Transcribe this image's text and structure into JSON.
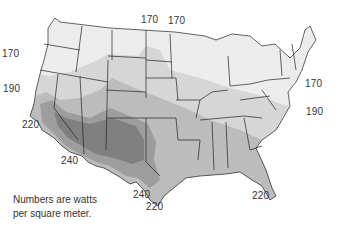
{
  "map": {
    "title": "",
    "subject": "Average solar radiation across the contiguous United States",
    "unit_note_line1": "Numbers are watts",
    "unit_note_line2": "per square meter.",
    "shading": {
      "lightest": "#ebebeb",
      "light": "#d6d6d6",
      "medium": "#bcbcbc",
      "dark": "#9d9d9d",
      "darkest": "#7e7e7e"
    },
    "contour_labels": [
      {
        "value": "170",
        "x": 147,
        "y": 20
      },
      {
        "value": "170",
        "x": 177,
        "y": 21
      },
      {
        "value": "170",
        "x": 16,
        "y": 54
      },
      {
        "value": "170",
        "x": 308,
        "y": 84
      },
      {
        "value": "190",
        "x": 13,
        "y": 84
      },
      {
        "value": "190",
        "x": 305,
        "y": 109
      },
      {
        "value": "220",
        "x": 23,
        "y": 119
      },
      {
        "value": "240",
        "x": 62,
        "y": 157
      },
      {
        "value": "240",
        "x": 133,
        "y": 189
      },
      {
        "value": "220",
        "x": 139,
        "y": 202
      },
      {
        "value": "220",
        "x": 252,
        "y": 190
      }
    ]
  }
}
